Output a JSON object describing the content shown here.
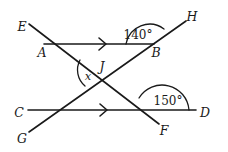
{
  "figure": {
    "type": "geometry-diagram",
    "background_color": "#ffffff",
    "stroke_color": "#1a1a1a"
  },
  "points": {
    "E": {
      "label": "E",
      "x": 22,
      "y": 27
    },
    "A": {
      "label": "A",
      "x": 42,
      "y": 53
    },
    "H": {
      "label": "H",
      "x": 192,
      "y": 17
    },
    "B": {
      "label": "B",
      "x": 156,
      "y": 53
    },
    "J": {
      "label": "J",
      "x": 102,
      "y": 67
    },
    "C": {
      "label": "C",
      "x": 19,
      "y": 113
    },
    "D": {
      "label": "D",
      "x": 205,
      "y": 113
    },
    "G": {
      "label": "G",
      "x": 22,
      "y": 139
    },
    "F": {
      "label": "F",
      "x": 164,
      "y": 131
    }
  },
  "angles": {
    "at_B": {
      "label": "140°",
      "value": 140,
      "x": 138,
      "y": 35
    },
    "at_F": {
      "label": "150°",
      "value": 150,
      "x": 168,
      "y": 101
    },
    "at_J": {
      "label": "x",
      "value": null,
      "x": 88,
      "y": 77
    }
  },
  "lines": [
    {
      "name": "line-AB",
      "from": "A",
      "to": "B",
      "parallel_mark": true
    },
    {
      "name": "line-CD",
      "from": "C",
      "to": "D",
      "parallel_mark": true
    },
    {
      "name": "transversal-EF",
      "from": "E",
      "to": "F",
      "parallel_mark": false
    },
    {
      "name": "transversal-GH",
      "from": "G",
      "to": "H",
      "parallel_mark": false
    }
  ]
}
